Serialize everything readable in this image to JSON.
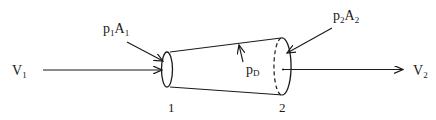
{
  "diagram": {
    "inlet_velocity": {
      "symbol": "V",
      "subscript": "1"
    },
    "outlet_velocity": {
      "symbol": "V",
      "subscript": "2"
    },
    "inlet_force": {
      "p": "p",
      "p_sub": "1",
      "a": "A",
      "a_sub": "1"
    },
    "outlet_force": {
      "p": "p",
      "p_sub": "2",
      "a": "A",
      "a_sub": "2"
    },
    "wall_pressure": {
      "symbol": "p",
      "subscript": "D"
    },
    "section_labels": [
      "1",
      "2"
    ],
    "colors": {
      "stroke": "#1a1a1a",
      "background": "#ffffff"
    }
  }
}
